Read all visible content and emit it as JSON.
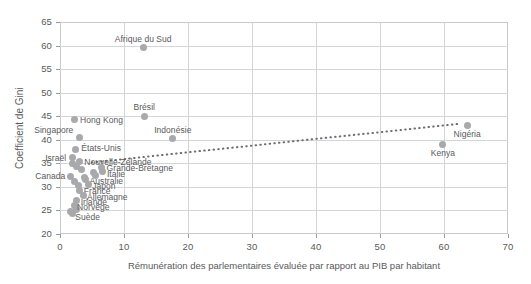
{
  "chart_data": {
    "type": "scatter",
    "title": "",
    "xlabel": "Rémunération des parlementaires évaluée par rapport au PIB par habitant",
    "ylabel": "Coefficient de Gini",
    "xlim": [
      0,
      70
    ],
    "ylim": [
      20,
      65
    ],
    "xticks": [
      0,
      10,
      20,
      30,
      40,
      50,
      60,
      70
    ],
    "yticks": [
      20,
      25,
      30,
      35,
      40,
      45,
      50,
      55,
      60,
      65
    ],
    "grid": true,
    "legend": "none",
    "marker_color": "#a7a9ac",
    "grid_color": "#d4d5d7",
    "axis_color": "#c9cacc",
    "text_color": "#58595b",
    "points": [
      {
        "label": "Afrique du Sud",
        "x": 13.0,
        "y": 59.5,
        "label_dx": 0,
        "label_dy": -9,
        "label_align": "center"
      },
      {
        "label": "Brésil",
        "x": 13.2,
        "y": 45.0,
        "label_dx": 0,
        "label_dy": -9,
        "label_align": "center"
      },
      {
        "label": "Indonésie",
        "x": 17.6,
        "y": 40.2,
        "label_dx": 0,
        "label_dy": -9,
        "label_align": "center"
      },
      {
        "label": "Hong Kong",
        "x": 2.2,
        "y": 44.2,
        "label_dx": 6,
        "label_dy": 0,
        "label_align": "left"
      },
      {
        "label": "Singapore",
        "x": 3.0,
        "y": 40.4,
        "label_dx": -6,
        "label_dy": -8,
        "label_align": "right"
      },
      {
        "label": "États-Unis",
        "x": 2.4,
        "y": 38.0,
        "label_dx": 6,
        "label_dy": -1,
        "label_align": "left"
      },
      {
        "label": "Israël",
        "x": 1.9,
        "y": 36.2,
        "label_dx": -6,
        "label_dy": 0,
        "label_align": "right"
      },
      {
        "label": "Nouvelle-Zélande",
        "x": 3.0,
        "y": 35.3,
        "label_dx": 5,
        "label_dy": 0,
        "label_align": "left"
      },
      {
        "label": "Grande-Bretagne",
        "x": 6.5,
        "y": 34.2,
        "label_dx": 5,
        "label_dy": 1,
        "label_align": "left"
      },
      {
        "label": "Italie",
        "x": 6.7,
        "y": 33.2,
        "label_dx": 4,
        "label_dy": 2,
        "label_align": "left"
      },
      {
        "label": "Canada",
        "x": 1.6,
        "y": 32.3,
        "label_dx": -5,
        "label_dy": 0,
        "label_align": "right"
      },
      {
        "label": "Australie",
        "x": 4.0,
        "y": 31.5,
        "label_dx": 4,
        "label_dy": 1,
        "label_align": "left"
      },
      {
        "label": "Japon",
        "x": 4.4,
        "y": 30.5,
        "label_dx": 4,
        "label_dy": 1,
        "label_align": "left"
      },
      {
        "label": "France",
        "x": 3.1,
        "y": 29.3,
        "label_dx": 4,
        "label_dy": 1,
        "label_align": "left"
      },
      {
        "label": "Allemagne",
        "x": 3.6,
        "y": 28.1,
        "label_dx": 4,
        "label_dy": 1,
        "label_align": "left"
      },
      {
        "label": "Irlande",
        "x": 2.6,
        "y": 27.1,
        "label_dx": 4,
        "label_dy": 1,
        "label_align": "left"
      },
      {
        "label": "Norvège",
        "x": 2.2,
        "y": 26.0,
        "label_dx": 3,
        "label_dy": 1,
        "label_align": "left"
      },
      {
        "label": "Suède",
        "x": 1.9,
        "y": 24.3,
        "label_dx": 3,
        "label_dy": 3,
        "label_align": "left"
      },
      {
        "label": "Kenya",
        "x": 59.8,
        "y": 39.0,
        "label_dx": 0,
        "label_dy": 9,
        "label_align": "center"
      },
      {
        "label": "Nigéria",
        "x": 63.6,
        "y": 43.1,
        "label_dx": 0,
        "label_dy": 9,
        "label_align": "center"
      }
    ],
    "extra_points": [
      {
        "x": 2.0,
        "y": 35.0
      },
      {
        "x": 2.6,
        "y": 34.3
      },
      {
        "x": 3.4,
        "y": 33.6
      },
      {
        "x": 5.2,
        "y": 33.0
      },
      {
        "x": 2.3,
        "y": 31.2
      },
      {
        "x": 5.6,
        "y": 32.4
      },
      {
        "x": 2.9,
        "y": 30.2
      },
      {
        "x": 3.8,
        "y": 32.0
      },
      {
        "x": 1.7,
        "y": 24.8
      },
      {
        "x": 2.5,
        "y": 25.2
      }
    ],
    "trendline": {
      "style": "dotted",
      "color": "#6d6e71",
      "x0": 5.0,
      "y0": 35.2,
      "x1": 62.5,
      "y1": 43.4
    }
  }
}
